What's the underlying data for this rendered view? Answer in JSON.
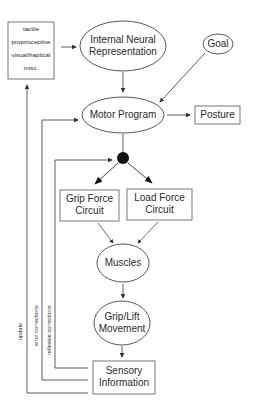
{
  "header": {
    "title": ""
  },
  "nodes": {
    "sensor_types": {
      "items": [
        "tactile",
        "proprioceptive",
        "visual/haptical",
        "misc."
      ]
    },
    "internal_neural": {
      "line1": "Internal Neural",
      "line2": "Representation"
    },
    "goal": {
      "label": "Goal"
    },
    "motor_program": {
      "label": "Motor Program"
    },
    "posture": {
      "label": "Posture"
    },
    "grip_force": {
      "line1": "Grip Force",
      "line2": "Circuit"
    },
    "load_force": {
      "line1": "Load Force",
      "line2": "Circuit"
    },
    "muscles": {
      "label": "Muscles"
    },
    "grip_lift": {
      "line1": "Grip/Lift",
      "line2": "Movement"
    },
    "sensory_info": {
      "line1": "Sensory",
      "line2": "Information"
    }
  },
  "feedback": {
    "update": "update",
    "error": "error corrections",
    "reflexive": "reflexive corrections"
  },
  "colors": {
    "stroke": "#444444",
    "text": "#2a2a2a",
    "background": "#ffffff"
  }
}
